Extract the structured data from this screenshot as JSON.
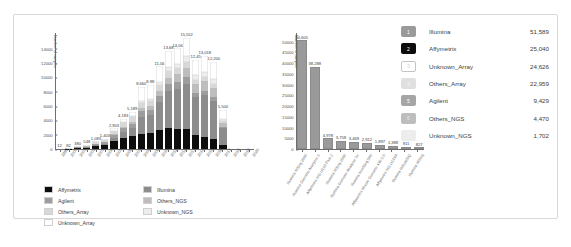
{
  "chart_data": [
    {
      "id": "yearly-stacked-platform-counts",
      "type": "bar",
      "stacked": true,
      "title": "",
      "xlabel": "",
      "ylabel": "Number of samples",
      "ylim": [
        0,
        15000
      ],
      "yticks": [
        0,
        2000,
        4000,
        6000,
        8000,
        10000,
        12000,
        14000
      ],
      "grid": false,
      "legend_position": "bottom",
      "categories": [
        "1999",
        "2000",
        "2001",
        "2002",
        "2003",
        "2004",
        "2005",
        "2006",
        "2007",
        "2008",
        "2009",
        "2010",
        "2011",
        "2012",
        "2013",
        "2014",
        "2015",
        "2016",
        "2017",
        "2018",
        "2019",
        "2020"
      ],
      "totals": [
        "12",
        "82",
        "380",
        "548",
        "1,083",
        "1,403",
        "2,903",
        "4,183",
        "5,189",
        "8,660",
        "8,98x",
        "11,56x",
        "13,6xx",
        "14,0xx",
        "15,552",
        "12,45x",
        "13,018",
        "12,200",
        "5,500"
      ],
      "totals_labels": [
        "12",
        "82",
        "380",
        "548",
        "1,083",
        "1,403",
        "2,903",
        "4,183",
        "5,189",
        "8,660",
        "8,98",
        "11,56",
        "13,68",
        "14,06",
        "15,552",
        "12,45",
        "13,018",
        "12,200",
        "5,500"
      ],
      "series": [
        {
          "name": "Affymetrix",
          "color": "#0d0d0d",
          "values": [
            4,
            28,
            130,
            190,
            380,
            520,
            1080,
            1580,
            1820,
            2100,
            2180,
            2600,
            2900,
            2850,
            2750,
            1900,
            1700,
            1350,
            520
          ]
        },
        {
          "name": "Illumina",
          "color": "#8c8c8c",
          "values": [
            0,
            6,
            40,
            70,
            150,
            230,
            480,
            760,
            1100,
            2400,
            2550,
            3900,
            5200,
            5600,
            6400,
            5300,
            5800,
            5400,
            2350
          ]
        },
        {
          "name": "Agilent",
          "color": "#9d9d9d",
          "values": [
            2,
            14,
            60,
            88,
            170,
            210,
            420,
            560,
            640,
            820,
            760,
            880,
            930,
            900,
            880,
            640,
            600,
            520,
            230
          ]
        },
        {
          "name": "Others_NGS",
          "color": "#bdbdbd",
          "values": [
            0,
            2,
            10,
            18,
            40,
            62,
            130,
            190,
            260,
            420,
            470,
            720,
            960,
            1080,
            1320,
            1180,
            1350,
            1280,
            600
          ]
        },
        {
          "name": "Others_Array",
          "color": "#d8d8d8",
          "values": [
            3,
            16,
            70,
            92,
            170,
            196,
            380,
            520,
            600,
            760,
            700,
            820,
            880,
            860,
            840,
            620,
            580,
            500,
            220
          ]
        },
        {
          "name": "Unknown_NGS",
          "color": "#ededed",
          "values": [
            0,
            1,
            6,
            10,
            23,
            35,
            73,
            103,
            149,
            240,
            260,
            420,
            560,
            640,
            780,
            690,
            780,
            740,
            340
          ]
        },
        {
          "name": "Unknown_Array",
          "color": "#ffffff",
          "values": [
            3,
            15,
            64,
            80,
            150,
            150,
            340,
            470,
            620,
            1920,
            2060,
            2220,
            2250,
            2130,
            2580,
            2120,
            2208,
            2410,
            1240
          ]
        }
      ]
    },
    {
      "id": "top-platform-counts",
      "type": "bar",
      "stacked": false,
      "title": "",
      "xlabel": "",
      "ylabel": "Number of samples",
      "ylim": [
        0,
        50000
      ],
      "yticks": [
        0,
        5000,
        10000,
        15000,
        20000,
        25000,
        30000,
        35000,
        40000,
        45000,
        50000
      ],
      "grid": false,
      "bar_color": "#9a9a9a",
      "categories": [
        "Illumina HiSeq 2000",
        "Illumina Genome Analyzer II",
        "Affymetrix HG-U133 Plus 2",
        "Illumina HiSeq 2500",
        "Illumina Genome Analyzer IIx",
        "Illumina NextSeq 500",
        "Affymetrix Mouse Genome 430 2.0",
        "Affymetrix HG-U133A",
        "Illumina HiScanSQ",
        "Illumina MiSeq"
      ],
      "values": [
        50605,
        38288,
        4978,
        3758,
        3469,
        2912,
        1897,
        1388,
        911,
        827
      ],
      "value_labels": [
        "50,605",
        "38,288",
        "4,978",
        "3,758",
        "3,469",
        "2,912",
        "1,897",
        "1,388",
        "911",
        "827"
      ]
    }
  ],
  "left_chart": {
    "ylabel": "Number of samples",
    "yticks": [
      "14000",
      "12000",
      "10000",
      "8000",
      "6000",
      "4000",
      "2000",
      "0"
    ],
    "legend": [
      {
        "label": "Affymetrix",
        "color": "#0d0d0d"
      },
      {
        "label": "Illumina",
        "color": "#8c8c8c"
      },
      {
        "label": "Agilent",
        "color": "#9d9d9d"
      },
      {
        "label": "Others_NGS",
        "color": "#bdbdbd"
      },
      {
        "label": "Others_Array",
        "color": "#d8d8d8"
      },
      {
        "label": "Unknown_NGS",
        "color": "#ededed"
      },
      {
        "label": "Unknown_Array",
        "color": "#ffffff"
      }
    ]
  },
  "mid_chart": {
    "ylabel": "Number of samples",
    "yticks": [
      "50000",
      "45000",
      "40000",
      "35000",
      "30000",
      "25000",
      "20000",
      "15000",
      "10000",
      "5000",
      "0"
    ]
  },
  "summary_table": {
    "rows": [
      {
        "rank": "1",
        "name": "Illumina",
        "value": "51,589",
        "swatch": "#9a9a9a",
        "text": "#ffffff",
        "border": "none"
      },
      {
        "rank": "2",
        "name": "Affymetrix",
        "value": "25,040",
        "swatch": "#0d0d0d",
        "text": "#ffffff",
        "border": "none"
      },
      {
        "rank": "3",
        "name": "Unknown_Array",
        "value": "24,626",
        "swatch": "#ffffff",
        "text": "#cfcfcf",
        "border": "1px solid #c4c4c4"
      },
      {
        "rank": "4",
        "name": "Others_Array",
        "value": "22,959",
        "swatch": "#e0e0e0",
        "text": "#f2f2f2",
        "border": "none"
      },
      {
        "rank": "5",
        "name": "Agilent",
        "value": "9,429",
        "swatch": "#a5a5a5",
        "text": "#ffffff",
        "border": "none"
      },
      {
        "rank": "6",
        "name": "Others_NGS",
        "value": "4,470",
        "swatch": "#bdbdbd",
        "text": "#e8e8e8",
        "border": "none"
      },
      {
        "rank": "7",
        "name": "Unknown_NGS",
        "value": "1,702",
        "swatch": "#ededed",
        "text": "#f8f8f8",
        "border": "none"
      }
    ]
  }
}
